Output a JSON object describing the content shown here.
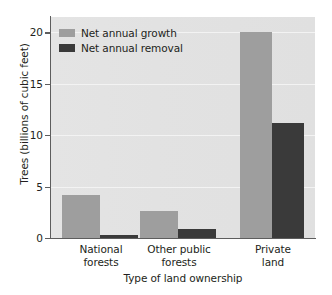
{
  "chart_data": {
    "type": "bar",
    "title": "",
    "categories": [
      "National forests",
      "Other public forests",
      "Private land"
    ],
    "category_lines": [
      [
        "National",
        "forests"
      ],
      [
        "Other public",
        "forests"
      ],
      [
        "Private",
        "land"
      ]
    ],
    "series": [
      {
        "name": "Net annual growth",
        "values": [
          4.2,
          2.6,
          20.0
        ],
        "color": "#9e9e9e"
      },
      {
        "name": "Net annual removal",
        "values": [
          0.3,
          0.9,
          11.2
        ],
        "color": "#3a3a3a"
      }
    ],
    "xlabel": "Type of land ownership",
    "ylabel": "Trees (billions of cubic feet)",
    "ylim": [
      0,
      21.5
    ],
    "yticks": [
      0,
      5,
      10,
      15,
      20
    ],
    "ytick_labels": [
      "0",
      "5",
      "10",
      "15",
      "20"
    ],
    "grid": true,
    "gridlines_at": [
      5,
      10,
      15,
      20
    ],
    "legend_position": "top-left",
    "plot_background": "#e2e2e2",
    "axis_color": "#5d5d5d",
    "text_color": "#231f20"
  }
}
